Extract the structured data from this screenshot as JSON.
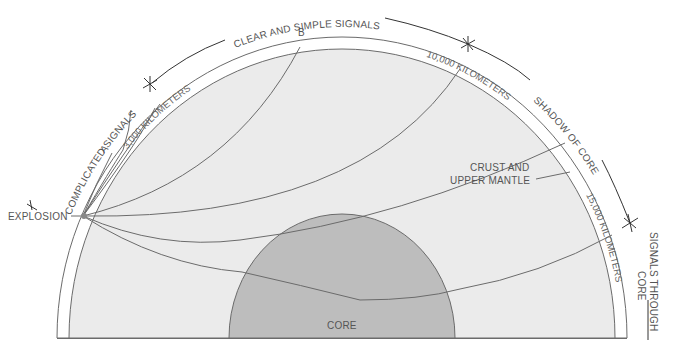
{
  "diagram": {
    "colors": {
      "mantle_fill": "#ebebeb",
      "core_fill": "#bdbdbd",
      "line": "#6b6b6b",
      "arc": "#333333",
      "text": "#555555"
    },
    "labels": {
      "explosion": "EXPLOSION",
      "complicated_signals": "COMPLICATED SIGNALS",
      "clear_signals": "CLEAR AND SIMPLE SIGNALS",
      "shadow_of_core": "SHADOW OF CORE",
      "signals_through_core_1": "SIGNALS THROUGH",
      "signals_through_core_2": "CORE",
      "crust_1": "CRUST AND",
      "crust_2": "UPPER MANTLE",
      "core": "CORE",
      "point_a": "A",
      "point_b": "B",
      "dist_3000": "3,000 KILOMETERS",
      "dist_10000": "10,000 KILOMETERS",
      "dist_15000": "15,000 KILOMETERS"
    },
    "icons": {
      "zone_boundary_marker": "asterisk-marker-icon",
      "arrow": "arrowhead-icon"
    }
  }
}
